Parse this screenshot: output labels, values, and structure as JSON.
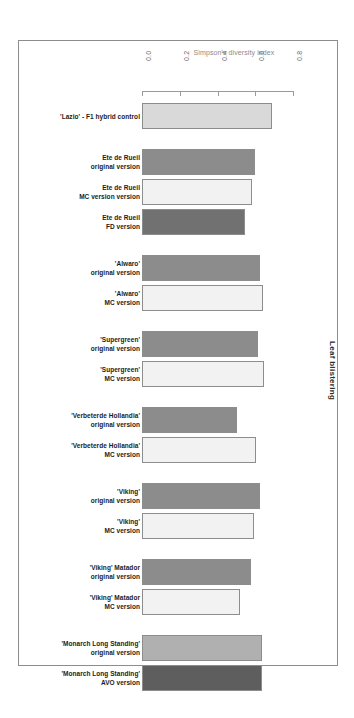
{
  "figure": {
    "axis_title": "Simpson's diversity index",
    "y_axis_caption": "Leaf blistering"
  },
  "chart_data": {
    "type": "bar",
    "orientation": "horizontal",
    "title": "",
    "xlabel": "Simpson's diversity index",
    "ylabel": "Leaf blistering",
    "xlim": [
      0.0,
      0.9
    ],
    "xticks": [
      0.0,
      0.2,
      0.4,
      0.6,
      0.8
    ],
    "xtick_labels": [
      "0.0",
      "0.2",
      "0.4",
      "0.6",
      "0.8"
    ],
    "grid": false,
    "legend": null,
    "groups": [
      {
        "name": "'Lazio' - F1 hybrid control",
        "bars": [
          {
            "label": "'Lazio' - F1 hybrid control",
            "value": 0.69,
            "color": "#d9d9d9"
          }
        ]
      },
      {
        "name": "Ete de Rueil",
        "bars": [
          {
            "label": "Ete de Rueil\noriginal version",
            "value": 0.6,
            "color": "#8c8c8c"
          },
          {
            "label": "Ete de Rueil\nMC version version",
            "value": 0.58,
            "color": "#f2f2f2"
          },
          {
            "label": "Ete de Rueil\nFD version",
            "value": 0.545,
            "color": "#717171"
          }
        ]
      },
      {
        "name": "'Alwaro'",
        "bars": [
          {
            "label": "'Alwaro'\noriginal version",
            "value": 0.625,
            "color": "#8c8c8c"
          },
          {
            "label": "'Alwaro'\nMC version",
            "value": 0.64,
            "color": "#f2f2f2"
          }
        ]
      },
      {
        "name": "'Supergreen'",
        "bars": [
          {
            "label": "'Supergreen'\noriginal version",
            "value": 0.615,
            "color": "#8c8c8c"
          },
          {
            "label": "'Supergreen'\nMC version",
            "value": 0.645,
            "color": "#f2f2f2"
          }
        ]
      },
      {
        "name": "'Verbeterde Hollandia'",
        "bars": [
          {
            "label": "'Verbeterde Hollandia'\noriginal version",
            "value": 0.5,
            "color": "#8c8c8c"
          },
          {
            "label": "'Verbeterde Hollandia'\nMC version",
            "value": 0.605,
            "color": "#f2f2f2"
          }
        ]
      },
      {
        "name": "'Viking'",
        "bars": [
          {
            "label": "'Viking'\noriginal version",
            "value": 0.625,
            "color": "#8c8c8c"
          },
          {
            "label": "'Viking'\nMC version",
            "value": 0.595,
            "color": "#f2f2f2"
          }
        ]
      },
      {
        "name": "'Viking' Matador",
        "bars": [
          {
            "label": "'Viking' Matador\noriginal version",
            "value": 0.575,
            "color": "#8c8c8c"
          },
          {
            "label": "'Viking' Matador\nMC version",
            "value": 0.52,
            "color": "#f2f2f2"
          }
        ]
      },
      {
        "name": "'Monarch Long Standing'",
        "bars": [
          {
            "label": "'Monarch Long Standing'\noriginal version",
            "value": 0.635,
            "color": "#b0b0b0"
          },
          {
            "label": "'Monarch Long Standing'\nAVO version",
            "value": 0.635,
            "color": "#5e5e5e"
          }
        ]
      }
    ]
  }
}
